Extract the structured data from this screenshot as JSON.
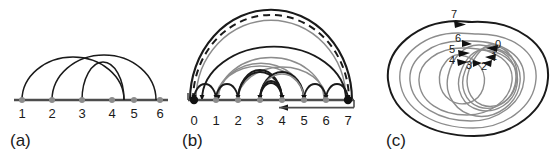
{
  "figure": {
    "width": 557,
    "height": 153,
    "background": "#ffffff",
    "stroke_dark": "#1a1a1a",
    "stroke_gray": "#8c8c8c",
    "node_fill_gray": "#8c8c8c",
    "node_fill_black": "#111111"
  },
  "panels": [
    {
      "id": "a",
      "caption": "(a)",
      "type": "arc-diagram-undirected",
      "axis": {
        "from": 1,
        "to": 6,
        "tick_labels": [
          "1",
          "2",
          "3",
          "4",
          "5",
          "6"
        ]
      },
      "nodes": [
        {
          "label": "1",
          "x": 1
        },
        {
          "label": "2",
          "x": 2
        },
        {
          "label": "3",
          "x": 3
        },
        {
          "label": "4",
          "x": 4
        },
        {
          "label": "5",
          "x": 5
        },
        {
          "label": "6",
          "x": 6
        }
      ],
      "arcs": [
        {
          "from": 1,
          "to": 5,
          "style": "solid",
          "color": "#1a1a1a"
        },
        {
          "from": 2,
          "to": 4,
          "style": "solid",
          "color": "#1a1a1a"
        },
        {
          "from": 3,
          "to": 6,
          "style": "solid",
          "color": "#1a1a1a"
        }
      ]
    },
    {
      "id": "b",
      "caption": "(b)",
      "type": "arc-diagram-directed",
      "axis": {
        "from": 0,
        "to": 7,
        "tick_labels": [
          "0",
          "1",
          "2",
          "3",
          "4",
          "5",
          "6",
          "7"
        ],
        "baseline_arrow": {
          "at": 4,
          "direction": "left"
        }
      },
      "nodes": [
        {
          "label": "0",
          "x": 0,
          "shape": "square-terminal",
          "fill": "#111111"
        },
        {
          "label": "1",
          "x": 1,
          "shape": "dot",
          "fill": "#8c8c8c"
        },
        {
          "label": "2",
          "x": 2,
          "shape": "dot",
          "fill": "#8c8c8c"
        },
        {
          "label": "3",
          "x": 3,
          "shape": "dot",
          "fill": "#8c8c8c"
        },
        {
          "label": "4",
          "x": 4,
          "shape": "dot",
          "fill": "#8c8c8c"
        },
        {
          "label": "5",
          "x": 5,
          "shape": "dot",
          "fill": "#8c8c8c"
        },
        {
          "label": "6",
          "x": 6,
          "shape": "dot",
          "fill": "#8c8c8c"
        },
        {
          "label": "7",
          "x": 7,
          "shape": "square-terminal",
          "fill": "#111111"
        }
      ],
      "arcs": [
        {
          "from": 0,
          "to": 7,
          "style": "solid",
          "color": "#1a1a1a",
          "height": 1.0,
          "arrow": "none"
        },
        {
          "from": 0,
          "to": 7,
          "style": "dashed",
          "color": "#1a1a1a",
          "height": 0.93,
          "arrow": "none"
        },
        {
          "from": 0,
          "to": 7,
          "style": "solid",
          "color": "#8c8c8c",
          "height": 0.86,
          "arrow": "none"
        },
        {
          "from": 7,
          "to": 0,
          "style": "solid",
          "color": "#1a1a1a",
          "height": 0.62,
          "arrow": "end"
        },
        {
          "from": 6,
          "to": 1,
          "style": "solid",
          "color": "#8c8c8c",
          "height": 0.55,
          "arrow": "end"
        },
        {
          "from": 5,
          "to": 1,
          "style": "solid",
          "color": "#8c8c8c",
          "height": 0.5,
          "arrow": "end"
        },
        {
          "from": 1,
          "to": 5,
          "style": "solid",
          "color": "#8c8c8c",
          "height": 0.47,
          "arrow": "end"
        },
        {
          "from": 2,
          "to": 6,
          "style": "solid",
          "color": "#8c8c8c",
          "height": 0.45,
          "arrow": "end"
        },
        {
          "from": 4,
          "to": 2,
          "style": "solid",
          "color": "#1a1a1a",
          "height": 0.42,
          "arrow": "end"
        },
        {
          "from": 2,
          "to": 4,
          "style": "solid",
          "color": "#1a1a1a",
          "height": 0.4,
          "arrow": "end"
        },
        {
          "from": 5,
          "to": 3,
          "style": "solid",
          "color": "#1a1a1a",
          "height": 0.38,
          "arrow": "end"
        },
        {
          "from": 3,
          "to": 5,
          "style": "solid",
          "color": "#8c8c8c",
          "height": 0.36,
          "arrow": "end"
        },
        {
          "from": 4,
          "to": 3,
          "style": "solid",
          "color": "#1a1a1a",
          "height": 0.26,
          "arrow": "end"
        },
        {
          "from": 3,
          "to": 4,
          "style": "solid",
          "color": "#1a1a1a",
          "height": 0.24,
          "arrow": "end"
        },
        {
          "from": 6,
          "to": 5,
          "style": "solid",
          "color": "#1a1a1a",
          "height": 0.22,
          "arrow": "end"
        },
        {
          "from": 1,
          "to": 0,
          "style": "solid",
          "color": "#1a1a1a",
          "height": 0.22,
          "arrow": "end"
        },
        {
          "from": 2,
          "to": 1,
          "style": "solid",
          "color": "#1a1a1a",
          "height": 0.22,
          "arrow": "end"
        },
        {
          "from": 6,
          "to": 7,
          "style": "solid",
          "color": "#1a1a1a",
          "height": 0.22,
          "arrow": "end"
        }
      ]
    },
    {
      "id": "c",
      "caption": "(c)",
      "type": "nested-loops",
      "node_labels": [
        "0",
        "1",
        "2",
        "3",
        "4",
        "5",
        "6",
        "7"
      ],
      "description": "Concentric nested closed loops converging at a common hub; labels 0-7 mark arrowhead entry points, 7 on the outermost loop.",
      "labels": [
        {
          "text": "7",
          "x": 88,
          "y": 16
        },
        {
          "text": "6",
          "x": 92,
          "y": 38
        },
        {
          "text": "5",
          "x": 85,
          "y": 52
        },
        {
          "text": "4",
          "x": 83,
          "y": 64
        },
        {
          "text": "3",
          "x": 99,
          "y": 67
        },
        {
          "text": "2",
          "x": 112,
          "y": 68
        },
        {
          "text": "1",
          "x": 120,
          "y": 58
        },
        {
          "text": "0",
          "x": 124,
          "y": 45
        }
      ]
    }
  ]
}
